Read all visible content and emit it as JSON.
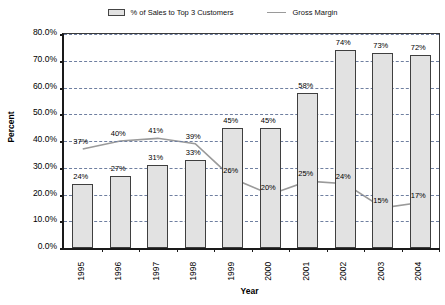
{
  "chart_data": {
    "type": "bar",
    "title": "",
    "xlabel": "Year",
    "ylabel": "Percent",
    "categories": [
      "1995",
      "1996",
      "1997",
      "1998",
      "1999",
      "2000",
      "2001",
      "2002",
      "2003",
      "2004"
    ],
    "ylim": [
      0,
      80
    ],
    "ytick_labels": [
      "0.0%",
      "10.0%",
      "20.0%",
      "30.0%",
      "40.0%",
      "50.0%",
      "60.0%",
      "70.0%",
      "80.0%"
    ],
    "ytick_values": [
      0,
      10,
      20,
      30,
      40,
      50,
      60,
      70,
      80
    ],
    "grid": true,
    "legend_position": "top-center",
    "series": [
      {
        "name": "% of Sales to Top 3 Customers",
        "type": "bar",
        "values": [
          24,
          27,
          31,
          33,
          45,
          45,
          58,
          74,
          73,
          72
        ],
        "data_labels": [
          "24%",
          "27%",
          "31%",
          "33%",
          "45%",
          "45%",
          "58%",
          "74%",
          "73%",
          "72%"
        ],
        "fill_color": "#e2e2e2",
        "border_color": "#3f3f3f"
      },
      {
        "name": "Gross Margin",
        "type": "line",
        "values": [
          37,
          40,
          41,
          39,
          26,
          20,
          25,
          24,
          15,
          17
        ],
        "data_labels": [
          "37%",
          "40%",
          "41%",
          "39%",
          "26%",
          "20%",
          "25%",
          "24%",
          "15%",
          "17%"
        ],
        "line_color": "#9a9a9a"
      }
    ]
  },
  "legend": {
    "bar_label": "% of Sales to Top 3 Customers",
    "line_label": "Gross Margin"
  },
  "axes": {
    "y_title": "Percent",
    "x_title": "Year"
  }
}
